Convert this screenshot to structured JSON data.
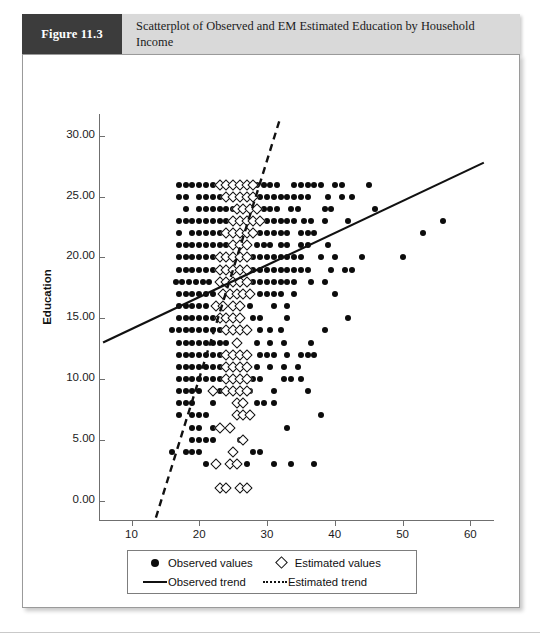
{
  "header": {
    "figure_label": "Figure 11.3",
    "title": "Scatterplot of Observed and EM Estimated Education by Household Income"
  },
  "legend": {
    "observed_values": "Observed values",
    "estimated_values": "Estimated values",
    "observed_trend": "Observed trend",
    "estimated_trend": "Estimated trend"
  },
  "colors": {
    "figure_box": "#3c3c3c",
    "banner": "#d9d9d9",
    "marker": "#0c0c0c",
    "axis": "#6f6f6f",
    "frame": "#9a9a9a"
  },
  "chart_data": {
    "type": "scatter",
    "title": "Scatterplot of Observed and EM Estimated Education by Household Income",
    "xlabel": "",
    "ylabel": "Education",
    "xlim": [
      5.2,
      63.5
    ],
    "ylim": [
      -1.6,
      31.8
    ],
    "grid": false,
    "legend_position": "bottom",
    "xticks": [
      10,
      20,
      30,
      40,
      50,
      60
    ],
    "xticklabels": [
      "10",
      "20",
      "30",
      "40",
      "50",
      "60"
    ],
    "yticks": [
      0,
      5,
      10,
      15,
      20,
      25,
      30
    ],
    "yticklabels": [
      "0.00",
      "5.00",
      "10.00",
      "15.00",
      "20.00",
      "25.00",
      "30.00"
    ],
    "series": [
      {
        "name": "Observed values",
        "marker": "filled-circle",
        "rows": [
          {
            "y": 26,
            "x": [
              17.0,
              18.0,
              19.0,
              20.0,
              21.0,
              22.0,
              28.5,
              29.5,
              30.5,
              31.5,
              34.0,
              35.0,
              36.0,
              37.0,
              38.0,
              40.0,
              41.0,
              45.0
            ]
          },
          {
            "y": 25,
            "x": [
              17.0,
              18.0,
              20.0,
              21.0,
              22.0,
              23.0,
              29.0,
              30.0,
              31.0,
              32.0,
              33.0,
              34.0,
              35.0,
              36.0,
              39.0,
              41.0,
              42.5
            ]
          },
          {
            "y": 24,
            "x": [
              18.0,
              20.0,
              21.0,
              22.0,
              23.0,
              24.0,
              25.0,
              29.5,
              30.5,
              31.5,
              33.5,
              34.5,
              38.5,
              39.5,
              46.0
            ]
          },
          {
            "y": 23,
            "x": [
              17.0,
              18.0,
              19.0,
              20.0,
              21.0,
              22.0,
              23.0,
              24.0,
              30.0,
              31.0,
              32.0,
              33.0,
              34.0,
              35.5,
              36.5,
              38.5,
              42.0,
              56.0
            ]
          },
          {
            "y": 22,
            "x": [
              17.0,
              19.0,
              20.0,
              21.0,
              22.0,
              23.0,
              29.0,
              30.0,
              31.0,
              32.0,
              33.0,
              35.0,
              36.0,
              37.0,
              53.0
            ]
          },
          {
            "y": 21,
            "x": [
              17.0,
              18.0,
              19.0,
              20.0,
              21.0,
              22.0,
              23.0,
              24.0,
              28.5,
              29.5,
              30.5,
              32.0,
              33.0,
              35.0,
              36.0,
              39.0
            ]
          },
          {
            "y": 20,
            "x": [
              17.0,
              18.0,
              19.0,
              20.0,
              21.0,
              22.0,
              28.0,
              29.0,
              30.0,
              31.0,
              32.0,
              33.0,
              34.0,
              35.0,
              38.0,
              40.0,
              44.0,
              50.0
            ]
          },
          {
            "y": 19,
            "x": [
              17.0,
              18.0,
              19.0,
              20.0,
              21.0,
              22.0,
              23.0,
              28.0,
              29.0,
              30.0,
              31.0,
              32.0,
              33.0,
              34.0,
              35.0,
              36.0,
              39.5,
              41.5,
              42.5
            ]
          },
          {
            "y": 18,
            "x": [
              16.5,
              17.5,
              18.5,
              19.5,
              20.5,
              21.5,
              28.0,
              29.0,
              30.0,
              31.0,
              32.0,
              33.0,
              34.0,
              36.5,
              38.5
            ]
          },
          {
            "y": 17,
            "x": [
              17.0,
              18.0,
              19.0,
              20.0,
              21.0,
              22.0,
              29.0,
              30.0,
              31.0,
              32.0,
              34.0,
              40.0
            ]
          },
          {
            "y": 16,
            "x": [
              17.0,
              18.0,
              19.0,
              20.0,
              21.0,
              27.5,
              31.0,
              33.0
            ]
          },
          {
            "y": 15,
            "x": [
              17.0,
              18.0,
              19.0,
              20.0,
              21.0,
              22.0,
              28.0,
              29.0,
              33.0,
              42.0
            ]
          },
          {
            "y": 14,
            "x": [
              16.0,
              17.0,
              18.0,
              19.0,
              20.0,
              21.0,
              22.0,
              23.0,
              29.0,
              30.5,
              32.0,
              38.5
            ]
          },
          {
            "y": 13,
            "x": [
              17.0,
              18.0,
              19.0,
              20.0,
              21.0,
              22.0,
              23.0,
              24.0,
              28.5,
              30.5,
              32.5,
              36.5
            ]
          },
          {
            "y": 12,
            "x": [
              17.0,
              18.0,
              19.0,
              20.0,
              21.0,
              22.0,
              23.0,
              29.0,
              30.0,
              31.0,
              33.0,
              35.0,
              36.0,
              37.0
            ]
          },
          {
            "y": 11,
            "x": [
              17.0,
              18.0,
              19.0,
              20.0,
              21.0,
              22.0,
              23.0,
              24.0,
              28.5,
              30.5,
              32.5,
              34.5
            ]
          },
          {
            "y": 10,
            "x": [
              17.0,
              18.0,
              19.0,
              20.0,
              21.0,
              22.0,
              23.0,
              24.0,
              25.0,
              28.0,
              29.0,
              32.5,
              33.5,
              35.0
            ]
          },
          {
            "y": 9,
            "x": [
              17.0,
              18.0,
              19.0,
              20.0,
              23.0,
              24.0,
              27.5,
              31.0,
              36.0
            ]
          },
          {
            "y": 8,
            "x": [
              17.0,
              18.0,
              19.0,
              22.0,
              28.5,
              29.5,
              31.0
            ]
          },
          {
            "y": 7,
            "x": [
              17.0,
              19.0,
              20.0,
              21.0,
              26.0,
              38.0
            ]
          },
          {
            "y": 6,
            "x": [
              19.0,
              20.0,
              22.0,
              23.0,
              33.0
            ]
          },
          {
            "y": 5,
            "x": [
              19.0,
              20.0,
              21.0,
              22.0,
              26.0
            ]
          },
          {
            "y": 4,
            "x": [
              16.0,
              18.0,
              19.0,
              20.0,
              25.0,
              28.0,
              29.0
            ]
          },
          {
            "y": 3,
            "x": [
              21.0,
              27.0,
              31.0,
              33.5,
              37.0
            ]
          }
        ]
      },
      {
        "name": "Estimated values",
        "marker": "open-diamond",
        "rows": [
          {
            "y": 26,
            "x": [
              23.0,
              24.0,
              25.0,
              26.0,
              27.0,
              28.0
            ]
          },
          {
            "y": 25,
            "x": [
              24.0,
              25.0,
              26.0,
              27.0,
              28.0
            ]
          },
          {
            "y": 24,
            "x": [
              25.5,
              26.5,
              27.5,
              28.5
            ]
          },
          {
            "y": 23,
            "x": [
              25.0,
              26.0,
              27.0,
              28.0,
              29.0
            ]
          },
          {
            "y": 22,
            "x": [
              24.0,
              25.0,
              26.0,
              27.0,
              28.0
            ]
          },
          {
            "y": 21,
            "x": [
              25.0,
              26.0,
              27.0
            ]
          },
          {
            "y": 20,
            "x": [
              23.0,
              24.0,
              25.0,
              26.0,
              27.0
            ]
          },
          {
            "y": 19,
            "x": [
              23.0,
              24.0,
              25.0,
              26.0,
              27.0
            ]
          },
          {
            "y": 18,
            "x": [
              23.0,
              24.0,
              25.0,
              26.0,
              27.0
            ]
          },
          {
            "y": 17,
            "x": [
              23.5,
              24.5,
              25.5,
              26.5,
              27.5
            ]
          },
          {
            "y": 16,
            "x": [
              22.5,
              23.5,
              25.0,
              26.0
            ]
          },
          {
            "y": 15,
            "x": [
              23.0,
              24.0,
              25.0,
              26.0
            ]
          },
          {
            "y": 14,
            "x": [
              24.0,
              25.0,
              26.0,
              27.0
            ]
          },
          {
            "y": 13,
            "x": [
              25.5
            ]
          },
          {
            "y": 12,
            "x": [
              24.0,
              25.0,
              26.0,
              27.0
            ]
          },
          {
            "y": 11,
            "x": [
              24.0,
              25.0,
              26.0,
              27.0
            ]
          },
          {
            "y": 10,
            "x": [
              24.0,
              25.0,
              26.0,
              27.0
            ]
          },
          {
            "y": 9,
            "x": [
              22.0,
              24.0,
              25.0,
              26.0,
              27.0
            ]
          },
          {
            "y": 8,
            "x": [
              25.5,
              26.5
            ]
          },
          {
            "y": 7,
            "x": [
              25.5,
              26.5,
              27.5
            ]
          },
          {
            "y": 6,
            "x": [
              23.0,
              24.5
            ]
          },
          {
            "y": 5,
            "x": [
              26.5
            ]
          },
          {
            "y": 4,
            "x": [
              25.0
            ]
          },
          {
            "y": 3,
            "x": [
              22.5,
              24.5,
              25.5
            ]
          },
          {
            "y": 1,
            "x": [
              23.0,
              24.0,
              26.0,
              27.0
            ]
          }
        ]
      }
    ],
    "trends": [
      {
        "name": "Observed trend",
        "style": "solid",
        "x0": 5.8,
        "y0": 13.0,
        "x1": 62.0,
        "y1": 27.8
      },
      {
        "name": "Estimated trend",
        "style": "dashed",
        "x0": 13.6,
        "y0": -1.4,
        "x1": 31.8,
        "y1": 31.2
      }
    ]
  }
}
